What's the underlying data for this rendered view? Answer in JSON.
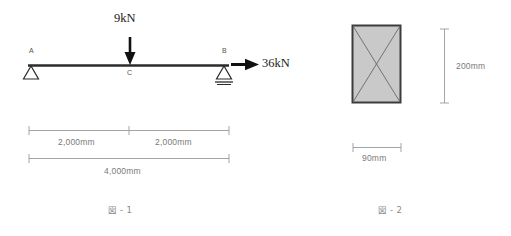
{
  "figure1": {
    "caption": "図 - 1",
    "type": "beam-free-body-diagram",
    "beam": {
      "label_left": "A",
      "label_mid": "C",
      "label_right": "B"
    },
    "loads": [
      {
        "name": "point-load",
        "label": "9kN",
        "magnitude": 9,
        "unit": "kN",
        "direction": "down",
        "at": "C"
      },
      {
        "name": "horizontal-load",
        "label": "36kN",
        "magnitude": 36,
        "unit": "kN",
        "direction": "right",
        "at": "B"
      }
    ],
    "supports": [
      {
        "at": "A",
        "type": "pin"
      },
      {
        "at": "B",
        "type": "roller"
      }
    ],
    "dimensions": [
      {
        "name": "span-left",
        "label": "2,000mm",
        "value": 2000,
        "unit": "mm"
      },
      {
        "name": "span-right",
        "label": "2,000mm",
        "value": 2000,
        "unit": "mm"
      },
      {
        "name": "span-total",
        "label": "4,000mm",
        "value": 4000,
        "unit": "mm"
      }
    ]
  },
  "figure2": {
    "caption": "図 - 2",
    "type": "cross-section",
    "shape": "rectangle",
    "fill_color": "#c9c9c9",
    "border_color": "#3c3c3c",
    "dimensions": [
      {
        "name": "height",
        "label": "200mm",
        "value": 200,
        "unit": "mm"
      },
      {
        "name": "width",
        "label": "90mm",
        "value": 90,
        "unit": "mm"
      }
    ]
  },
  "colors": {
    "background": "#ffffff",
    "beam": "#2b2b2b",
    "dimension_line": "#9a9a9a",
    "text": "#6b6b6b"
  }
}
